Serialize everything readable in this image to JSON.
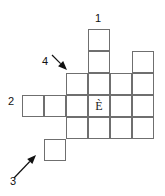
{
  "puzzle": {
    "type": "crossword-grid",
    "title": "",
    "cell_size": 22,
    "line_color": "#6f6f6f",
    "text_color": "#111111",
    "background": "#ffffff",
    "filled_letters": [
      {
        "id": "letter-e-grave",
        "char": "È",
        "col": 3,
        "row": 3
      }
    ],
    "cells": [
      {
        "col": 3,
        "row": 0
      },
      {
        "col": 3,
        "row": 1
      },
      {
        "col": 5,
        "row": 1
      },
      {
        "col": 2,
        "row": 2
      },
      {
        "col": 3,
        "row": 2
      },
      {
        "col": 4,
        "row": 2
      },
      {
        "col": 5,
        "row": 2
      },
      {
        "col": 0,
        "row": 3
      },
      {
        "col": 1,
        "row": 3
      },
      {
        "col": 2,
        "row": 3
      },
      {
        "col": 3,
        "row": 3
      },
      {
        "col": 4,
        "row": 3
      },
      {
        "col": 5,
        "row": 3
      },
      {
        "col": 2,
        "row": 4
      },
      {
        "col": 3,
        "row": 4
      },
      {
        "col": 4,
        "row": 4
      },
      {
        "col": 5,
        "row": 4
      },
      {
        "col": 1,
        "row": 5
      }
    ],
    "labels": [
      {
        "id": "clue-label-1",
        "text": "1",
        "x": 95,
        "y": 13
      },
      {
        "id": "clue-label-2",
        "text": "2",
        "x": 8,
        "y": 96
      },
      {
        "id": "clue-label-3",
        "text": "3",
        "x": 10,
        "y": 176
      },
      {
        "id": "clue-label-4",
        "text": "4",
        "x": 42,
        "y": 56
      }
    ],
    "arrows": [
      {
        "id": "arrow-4",
        "points_to": "clue-label-4",
        "from_x": 52,
        "from_y": 55,
        "to_x": 67,
        "to_y": 70,
        "direction": "down-right"
      },
      {
        "id": "arrow-3",
        "points_to": "clue-label-3",
        "from_x": 14,
        "from_y": 178,
        "to_x": 36,
        "to_y": 155,
        "direction": "up-right"
      }
    ]
  }
}
